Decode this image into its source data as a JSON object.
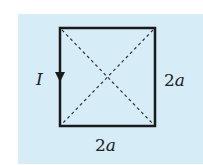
{
  "diagram": {
    "colors": {
      "background": "#d6ecf7",
      "stroke": "#1a1a1a",
      "dash": "#333333"
    },
    "current_label": "I",
    "side_right_label": {
      "coef": "2",
      "var": "a"
    },
    "side_bottom_label": {
      "coef": "2",
      "var": "a"
    },
    "current_direction": "down (left side)"
  }
}
